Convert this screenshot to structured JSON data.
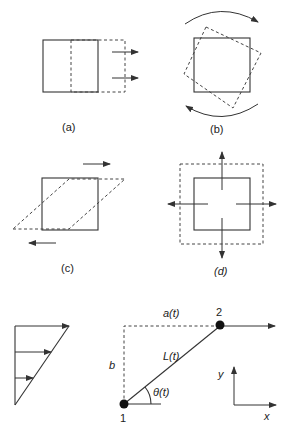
{
  "figure": {
    "panels": [
      {
        "id": "a",
        "label": "(a)",
        "description": "translation"
      },
      {
        "id": "b",
        "label": "(b)",
        "description": "rotation"
      },
      {
        "id": "c",
        "label": "(c)",
        "description": "shear"
      },
      {
        "id": "d",
        "label": "(d)",
        "description": "dilation"
      }
    ],
    "shear_flow": {
      "profile": "linear velocity profile with three arrows"
    },
    "kinematics": {
      "point1_label": "1",
      "point2_label": "2",
      "horizontal_label": "a(t)",
      "vertical_label": "b",
      "length_label": "L(t)",
      "angle_label": "θ(t)",
      "axis_x_label": "x",
      "axis_y_label": "y"
    }
  },
  "colors": {
    "ink": "#333333",
    "background": "#ffffff"
  }
}
